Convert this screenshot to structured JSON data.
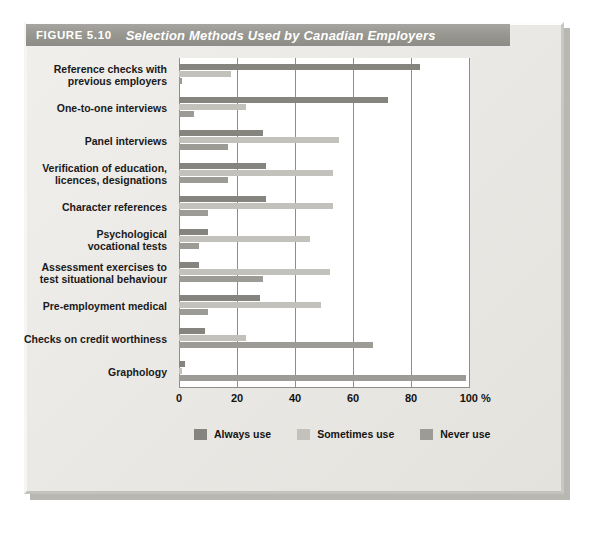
{
  "figure": {
    "number": "FIGURE 5.10",
    "title": "Selection Methods Used by Canadian Employers"
  },
  "chart_data": {
    "type": "bar",
    "orientation": "horizontal",
    "title": "Selection Methods Used by Canadian Employers",
    "xlabel": "%",
    "ylabel": "",
    "xlim": [
      0,
      100
    ],
    "xticks": [
      "0",
      "20",
      "40",
      "60",
      "80",
      "100 %"
    ],
    "xtick_values": [
      0,
      20,
      40,
      60,
      80,
      100
    ],
    "grid": true,
    "legend_position": "bottom",
    "categories": [
      "Reference checks with previous employers",
      "One-to-one interviews",
      "Panel interviews",
      "Verification of education, licences, designations",
      "Character references",
      "Psychological vocational tests",
      "Assessment exercises to test situational behaviour",
      "Pre-employment medical",
      "Checks on credit worthiness",
      "Graphology"
    ],
    "category_lines": [
      [
        "Reference checks with",
        "previous employers"
      ],
      [
        "One-to-one interviews"
      ],
      [
        "Panel interviews"
      ],
      [
        "Verification of education,",
        "licences, designations"
      ],
      [
        "Character references"
      ],
      [
        "Psychological",
        "vocational tests"
      ],
      [
        "Assessment exercises to",
        "test situational behaviour"
      ],
      [
        "Pre-employment medical"
      ],
      [
        "Checks on credit worthiness"
      ],
      [
        "Graphology"
      ]
    ],
    "series": [
      {
        "name": "Always use",
        "color": "#86847f",
        "values": [
          83,
          72,
          29,
          30,
          30,
          10,
          7,
          28,
          9,
          2
        ]
      },
      {
        "name": "Sometimes use",
        "color": "#c3c1bc",
        "values": [
          18,
          23,
          55,
          53,
          53,
          45,
          52,
          49,
          23,
          1
        ]
      },
      {
        "name": "Never use",
        "color": "#9d9b96",
        "values": [
          1,
          5,
          17,
          17,
          10,
          7,
          29,
          10,
          67,
          99
        ]
      }
    ]
  }
}
